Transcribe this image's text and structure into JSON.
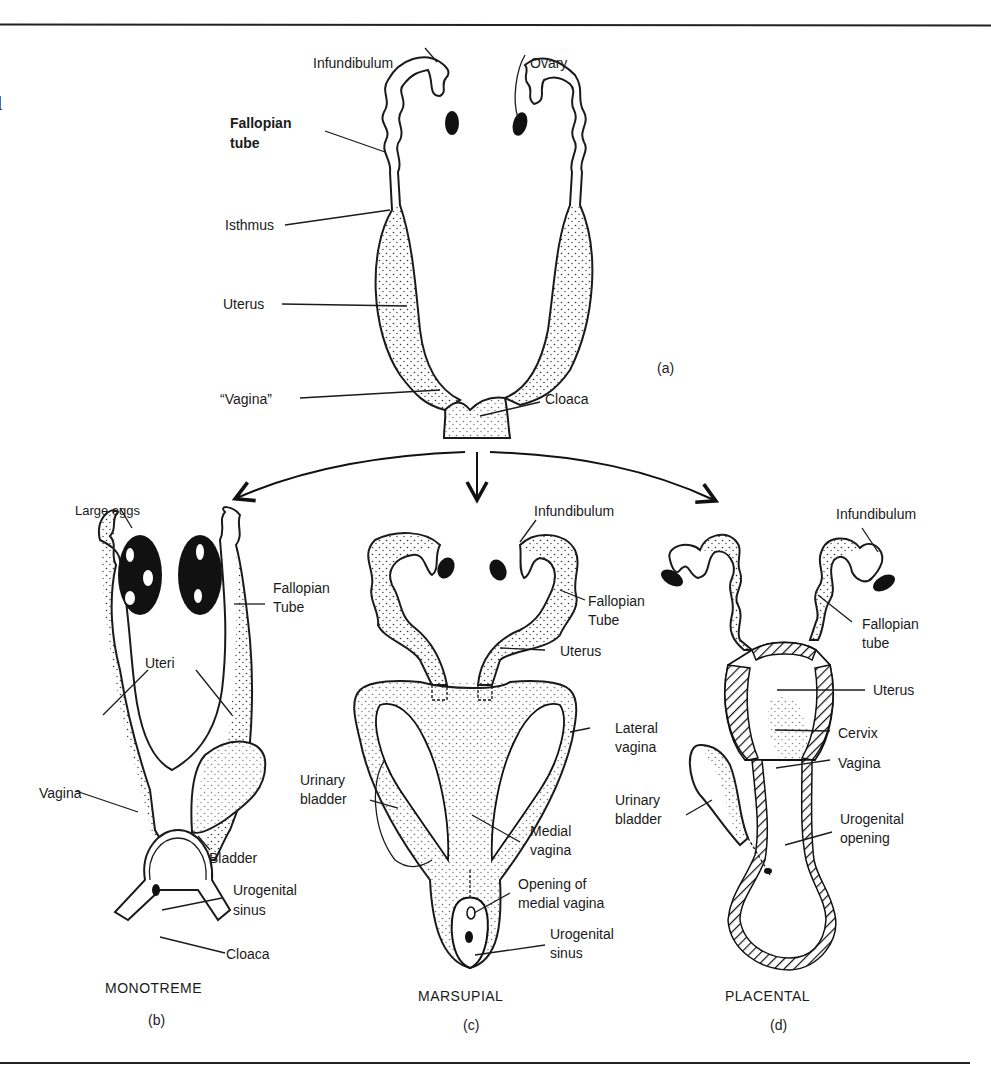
{
  "figure": {
    "stray_margin_char": "l",
    "panel_a": {
      "tag": "(a)",
      "labels": {
        "infundibulum": "Infundibulum",
        "ovary": "Ovary",
        "fallopian_tube_1": "Fallopian",
        "fallopian_tube_2": "tube",
        "isthmus": "Isthmus",
        "uterus": "Uterus",
        "vagina": "“Vagina”",
        "cloaca": "Cloaca"
      }
    },
    "panel_b": {
      "title": "MONOTREME",
      "tag": "(b)",
      "labels": {
        "large_eggs": "Large eggs",
        "fallopian_tube_1": "Fallopian",
        "fallopian_tube_2": "Tube",
        "uteri": "Uteri",
        "vagina": "Vagina",
        "bladder": "Bladder",
        "urogenital_sinus_1": "Urogenital",
        "urogenital_sinus_2": "sinus",
        "cloaca": "Cloaca"
      }
    },
    "panel_c": {
      "title": "MARSUPIAL",
      "tag": "(c)",
      "labels": {
        "infundibulum": "Infundibulum",
        "fallopian_tube_1": "Fallopian",
        "fallopian_tube_2": "Tube",
        "uterus": "Uterus",
        "lateral_vagina_1": "Lateral",
        "lateral_vagina_2": "vagina",
        "urinary_bladder_1": "Urinary",
        "urinary_bladder_2": "bladder",
        "medial_vagina_1": "Medial",
        "medial_vagina_2": "vagina",
        "opening_1": "Opening of",
        "opening_2": "medial vagina",
        "urogenital_sinus_1": "Urogenital",
        "urogenital_sinus_2": "sinus"
      }
    },
    "panel_d": {
      "title": "PLACENTAL",
      "tag": "(d)",
      "labels": {
        "infundibulum": "Infundibulum",
        "fallopian_tube_1": "Fallopian",
        "fallopian_tube_2": "tube",
        "uterus": "Uterus",
        "cervix": "Cervix",
        "vagina": "Vagina",
        "urinary_bladder_1": "Urinary",
        "urinary_bladder_2": "bladder",
        "urogenital_opening_1": "Urogenital",
        "urogenital_opening_2": "opening"
      }
    }
  }
}
